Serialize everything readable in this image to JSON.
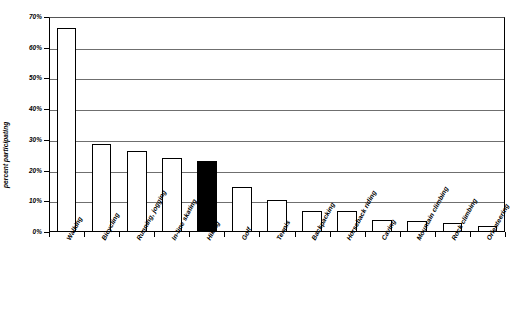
{
  "chart_data": {
    "type": "bar",
    "title": "",
    "subtitle": "",
    "xlabel": "",
    "ylabel": "percent participating",
    "ylim": [
      0,
      70
    ],
    "ytick_labels": [
      "0%",
      "10%",
      "20%",
      "30%",
      "40%",
      "50%",
      "60%",
      "70%"
    ],
    "ytick_values": [
      0,
      10,
      20,
      30,
      40,
      50,
      60,
      70
    ],
    "grid": true,
    "legend": "none",
    "value_unit": "percent",
    "highlight_category": "Hiking",
    "highlight_fill": "#000000",
    "bar_fill": "#ffffff",
    "bar_edge": "#000000",
    "gridline_color": "#6f6f6f",
    "categories": [
      "Walking",
      "Bicycling",
      "Running, jogging",
      "In-line skating",
      "Hiking",
      "Golf",
      "Tennis",
      "Backpacking",
      "Horseback riding",
      "Caving",
      "Mountain climbing",
      "Rock climbing",
      "Orienteering"
    ],
    "values": [
      66.5,
      28.5,
      26.5,
      24.0,
      23.0,
      14.5,
      10.5,
      7.0,
      6.8,
      4.0,
      3.7,
      3.0,
      2.0
    ]
  }
}
